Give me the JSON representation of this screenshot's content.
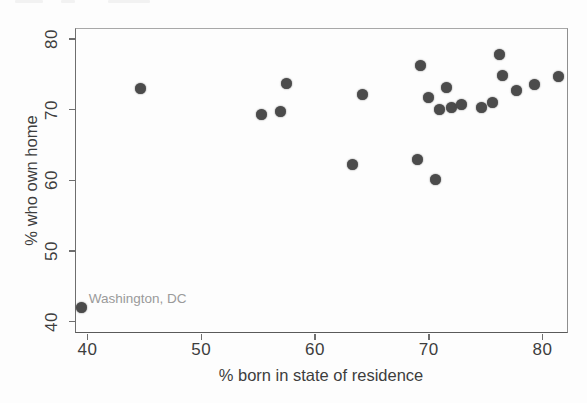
{
  "chart_data": {
    "type": "scatter",
    "title": "",
    "xlabel": "% born in state of residence",
    "ylabel": "% who own home",
    "xlim": [
      38.9,
      82.24
    ],
    "ylim": [
      38.4,
      81.55
    ],
    "x_ticks": [
      "40",
      "50",
      "60",
      "70",
      "80"
    ],
    "y_ticks": [
      "40",
      "50",
      "60",
      "70",
      "80"
    ],
    "grid": false,
    "legend": "none",
    "point_color": "#4b4b4b",
    "axis_color": "#6e6e6e",
    "label_color": "#3d3d3d",
    "annotation": {
      "text": "Washington, DC",
      "x": 39.5,
      "y": 42.0,
      "color": "#9a9a9a"
    },
    "points": [
      [
        39.5,
        42.0
      ],
      [
        44.7,
        73.0
      ],
      [
        55.3,
        69.3
      ],
      [
        57.0,
        69.8
      ],
      [
        57.5,
        73.7
      ],
      [
        63.3,
        62.3
      ],
      [
        64.2,
        72.1
      ],
      [
        69.0,
        63.0
      ],
      [
        69.3,
        76.2
      ],
      [
        70.0,
        71.7
      ],
      [
        70.6,
        60.1
      ],
      [
        70.9,
        70.0
      ],
      [
        71.6,
        73.1
      ],
      [
        72.0,
        70.3
      ],
      [
        72.9,
        70.7
      ],
      [
        74.6,
        70.3
      ],
      [
        75.6,
        71.0
      ],
      [
        76.2,
        77.8
      ],
      [
        76.5,
        74.9
      ],
      [
        77.7,
        72.7
      ],
      [
        79.3,
        73.5
      ],
      [
        81.4,
        74.7
      ]
    ]
  }
}
